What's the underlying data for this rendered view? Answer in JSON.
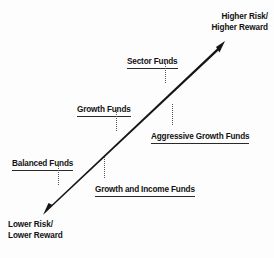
{
  "diagram": {
    "type": "risk-reward-spectrum",
    "background_color": "#fdfdfd",
    "bar_color": "#151515",
    "text_color": "#121212",
    "leader_color": "#55555b"
  },
  "endpoints": {
    "high": {
      "name": "higher-risk-reward",
      "line1": "Higher Risk/",
      "line2": "Higher Reward"
    },
    "low": {
      "name": "lower-risk-reward",
      "line1": "Lower Risk/",
      "line2": "Lower Reward"
    }
  },
  "callouts": [
    {
      "name": "sector-funds",
      "label": "Sector Funds",
      "side": "above",
      "rank": 5
    },
    {
      "name": "growth-funds",
      "label": "Growth Funds",
      "side": "above",
      "rank": 3
    },
    {
      "name": "aggressive-growth-funds",
      "label": "Aggressive Growth Funds",
      "side": "below",
      "rank": 4
    },
    {
      "name": "balanced-funds",
      "label": "Balanced Funds",
      "side": "above",
      "rank": 1
    },
    {
      "name": "growth-and-income-funds",
      "label": "Growth and Income Funds",
      "side": "below",
      "rank": 2
    }
  ]
}
